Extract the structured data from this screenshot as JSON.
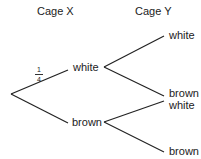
{
  "headers": {
    "cage_x": "Cage X",
    "cage_y": "Cage Y"
  },
  "tree": {
    "first": [
      {
        "label": "white",
        "probability": {
          "numerator": "1",
          "denominator": "4"
        }
      },
      {
        "label": "brown"
      }
    ],
    "second_after_white": [
      {
        "label": "white"
      },
      {
        "label": "brown"
      }
    ],
    "second_after_brown": [
      {
        "label": "white"
      },
      {
        "label": "brown"
      }
    ]
  },
  "colors": {
    "line": "#222222",
    "text": "#222222"
  }
}
